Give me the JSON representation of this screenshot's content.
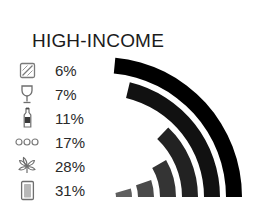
{
  "title": "HIGH-INCOME",
  "chart_data": {
    "type": "bar",
    "title": "HIGH-INCOME",
    "xlabel": "",
    "ylabel": "",
    "legend_position": "left",
    "grid": false,
    "categories": [
      "cocaine",
      "wine-glass",
      "bottle",
      "pills",
      "cannabis-leaf",
      "cigarette-pack"
    ],
    "values": [
      6,
      7,
      11,
      17,
      28,
      31
    ],
    "value_labels": [
      "6%",
      "7%",
      "11%",
      "17%",
      "28%",
      "31%"
    ],
    "unit": "%",
    "ylim": [
      0,
      100
    ],
    "colors": [
      "#5f5f5f",
      "#4a4a4a",
      "#343434",
      "#222222",
      "#111111",
      "#000000"
    ]
  },
  "legend": {
    "rows": [
      {
        "icon": "cocaine-icon",
        "value": "6%"
      },
      {
        "icon": "wine-glass-icon",
        "value": "7%"
      },
      {
        "icon": "bottle-icon",
        "value": "11%"
      },
      {
        "icon": "pills-icon",
        "value": "17%"
      },
      {
        "icon": "cannabis-leaf-icon",
        "value": "28%"
      },
      {
        "icon": "cigarette-pack-icon",
        "value": "31%"
      }
    ]
  },
  "colors": {
    "background": "#ffffff",
    "text": "#1b1b1b",
    "value_text": "#2a2a2a",
    "icon_stroke": "#7a7a7a"
  }
}
